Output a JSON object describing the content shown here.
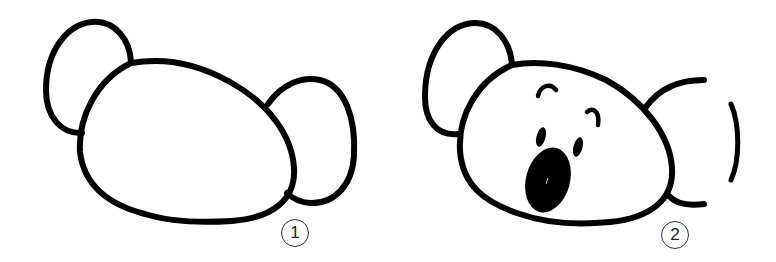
{
  "steps": [
    {
      "number": "1",
      "description": "Draw an oval head with two round ears"
    },
    {
      "number": "2",
      "description": "Add eyebrows, eyes and an open mouth; erase part of the right ear"
    }
  ],
  "colors": {
    "ink": "#000000",
    "background": "#ffffff",
    "label_ring": "#333333"
  }
}
